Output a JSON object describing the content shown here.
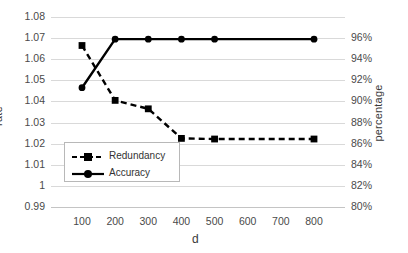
{
  "chart_data": {
    "type": "line",
    "title": "",
    "xlabel": "d",
    "ylabel": "rate",
    "y2label": "percentage",
    "x": [
      100,
      200,
      300,
      400,
      500,
      600,
      700,
      800
    ],
    "xtick_labels": [
      "100",
      "200",
      "300",
      "400",
      "500",
      "600",
      "700",
      "800"
    ],
    "ylim": [
      0.99,
      1.08
    ],
    "ytick_labels": [
      "1.08",
      "1.07",
      "1.06",
      "1.05",
      "1.04",
      "1.03",
      "1.02",
      "1.01",
      "1",
      "0.99"
    ],
    "ytick_values": [
      1.08,
      1.07,
      1.06,
      1.05,
      1.04,
      1.03,
      1.02,
      1.01,
      1.0,
      0.99
    ],
    "y2lim": [
      80,
      98
    ],
    "y2tick_labels": [
      "96%",
      "94%",
      "92%",
      "90%",
      "88%",
      "86%",
      "84%",
      "82%",
      "80%"
    ],
    "y2tick_values": [
      96,
      94,
      92,
      90,
      88,
      86,
      84,
      82,
      80
    ],
    "grid": true,
    "legend_position": "inside-lower-left",
    "series": [
      {
        "name": "Redundancy",
        "axis": "left",
        "style": "dashed",
        "marker": "square",
        "color": "#000000",
        "values": [
          1.0665,
          1.0405,
          1.0365,
          1.0225,
          1.0222,
          1.0222,
          1.0222,
          1.0222
        ]
      },
      {
        "name": "Accuracy",
        "axis": "right",
        "style": "solid",
        "marker": "circle",
        "color": "#000000",
        "values_rate": [
          1.0465,
          1.0695,
          1.0695,
          1.0695,
          1.0695,
          1.0695,
          1.0695,
          1.0695
        ],
        "values": [
          89.3,
          93.9,
          93.9,
          93.9,
          93.9,
          93.9,
          93.9,
          93.9
        ]
      }
    ]
  },
  "legend": {
    "items": [
      {
        "label": "Redundancy"
      },
      {
        "label": "Accuracy"
      }
    ]
  },
  "colors": {
    "series": "#000000",
    "grid": "#d9d9d9",
    "tick_text": "#4a4a4a",
    "background": "#ffffff"
  }
}
